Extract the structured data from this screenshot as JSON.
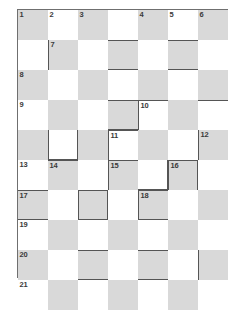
{
  "puzzle": {
    "kind": "crossword-grid",
    "columns": 7,
    "rows": 10,
    "cell_size": 30,
    "colors": {
      "shaded_cell": "#d9d9d9",
      "empty_cell": "#ffffff",
      "frame_border": "#6f6f6f",
      "entry_border": "#555555",
      "number_text": "#3a3a3a",
      "page_background": "#ffffff"
    },
    "shading_rule": "checkerboard: cell shaded when (row + column) is even",
    "numbers": [
      {
        "label": "1",
        "row": 1,
        "col": 1
      },
      {
        "label": "2",
        "row": 1,
        "col": 2
      },
      {
        "label": "3",
        "row": 1,
        "col": 3
      },
      {
        "label": "4",
        "row": 1,
        "col": 5
      },
      {
        "label": "5",
        "row": 1,
        "col": 6
      },
      {
        "label": "6",
        "row": 1,
        "col": 7
      },
      {
        "label": "7",
        "row": 2,
        "col": 2
      },
      {
        "label": "8",
        "row": 3,
        "col": 1
      },
      {
        "label": "9",
        "row": 4,
        "col": 1
      },
      {
        "label": "10",
        "row": 4,
        "col": 5
      },
      {
        "label": "11",
        "row": 5,
        "col": 4
      },
      {
        "label": "12",
        "row": 5,
        "col": 7
      },
      {
        "label": "13",
        "row": 6,
        "col": 1
      },
      {
        "label": "14",
        "row": 6,
        "col": 2
      },
      {
        "label": "15",
        "row": 6,
        "col": 4
      },
      {
        "label": "16",
        "row": 6,
        "col": 6
      },
      {
        "label": "17",
        "row": 7,
        "col": 1
      },
      {
        "label": "18",
        "row": 7,
        "col": 5
      },
      {
        "label": "19",
        "row": 8,
        "col": 1
      },
      {
        "label": "20",
        "row": 9,
        "col": 1
      },
      {
        "label": "21",
        "row": 10,
        "col": 1
      }
    ],
    "entry_borders": [
      {
        "row": 2,
        "col": 2,
        "sides": [
          "left"
        ]
      },
      {
        "row": 2,
        "col": 4,
        "sides": [
          "top",
          "bottom"
        ]
      },
      {
        "row": 2,
        "col": 6,
        "sides": [
          "top",
          "bottom"
        ]
      },
      {
        "row": 4,
        "col": 4,
        "sides": [
          "top",
          "bottom"
        ]
      },
      {
        "row": 4,
        "col": 5,
        "sides": [
          "top",
          "left"
        ]
      },
      {
        "row": 4,
        "col": 7,
        "sides": [
          "top"
        ]
      },
      {
        "row": 5,
        "col": 2,
        "sides": [
          "left",
          "right",
          "bottom"
        ]
      },
      {
        "row": 5,
        "col": 4,
        "sides": [
          "top",
          "left"
        ]
      },
      {
        "row": 5,
        "col": 7,
        "sides": [
          "left"
        ]
      },
      {
        "row": 6,
        "col": 2,
        "sides": [
          "top"
        ]
      },
      {
        "row": 6,
        "col": 4,
        "sides": [
          "top",
          "left"
        ]
      },
      {
        "row": 6,
        "col": 5,
        "sides": [
          "right",
          "bottom"
        ]
      },
      {
        "row": 6,
        "col": 6,
        "sides": [
          "top",
          "left",
          "right"
        ]
      },
      {
        "row": 7,
        "col": 1,
        "sides": [
          "top",
          "bottom"
        ]
      },
      {
        "row": 7,
        "col": 3,
        "sides": [
          "top",
          "left",
          "right",
          "bottom"
        ]
      },
      {
        "row": 7,
        "col": 5,
        "sides": [
          "top",
          "left",
          "bottom"
        ]
      },
      {
        "row": 9,
        "col": 3,
        "sides": [
          "top",
          "bottom"
        ]
      },
      {
        "row": 9,
        "col": 5,
        "sides": [
          "top",
          "bottom"
        ]
      },
      {
        "row": 9,
        "col": 7,
        "sides": [
          "left"
        ]
      }
    ]
  }
}
